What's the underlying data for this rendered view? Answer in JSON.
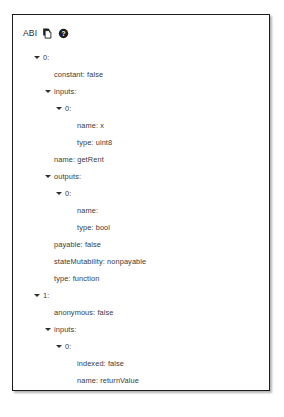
{
  "panel": {
    "header": {
      "title": "ABI",
      "copy_icon": "copy-icon",
      "help_icon": "help-circle-icon"
    }
  },
  "tree": {
    "rows": [
      {
        "text": "0:",
        "level": 1,
        "caret": true
      },
      {
        "text": "constant: false",
        "level": 2,
        "caret": false
      },
      {
        "text": "inputs:",
        "level": 2,
        "caret": true
      },
      {
        "text": "0:",
        "level": 3,
        "caret": true
      },
      {
        "text": "name: x",
        "level": 4,
        "caret": false
      },
      {
        "text": "type: uint8",
        "level": 4,
        "caret": false
      },
      {
        "text": "name: getRent",
        "level": 2,
        "caret": false
      },
      {
        "text": "outputs:",
        "level": 2,
        "caret": true
      },
      {
        "text": "0:",
        "level": 3,
        "caret": true
      },
      {
        "text": "name:",
        "level": 4,
        "caret": false
      },
      {
        "text": "type: bool",
        "level": 4,
        "caret": false
      },
      {
        "text": "payable: false",
        "level": 2,
        "caret": false
      },
      {
        "text": "stateMutability: nonpayable",
        "level": 2,
        "caret": false
      },
      {
        "text": "type: function",
        "level": 2,
        "caret": false
      },
      {
        "text": "1:",
        "level": 1,
        "caret": true
      },
      {
        "text": "anonymous: false",
        "level": 2,
        "caret": false
      },
      {
        "text": "inputs:",
        "level": 2,
        "caret": true
      },
      {
        "text": "0:",
        "level": 3,
        "caret": true
      },
      {
        "text": "indexed: false",
        "level": 4,
        "caret": false
      },
      {
        "text": "name: returnValue",
        "level": 4,
        "caret": false
      },
      {
        "text": "type: bool",
        "level": 4,
        "caret": false
      },
      {
        "text": "name: roomRented",
        "level": 2,
        "caret": false
      },
      {
        "text": "type: event",
        "level": 2,
        "caret": false
      }
    ]
  }
}
